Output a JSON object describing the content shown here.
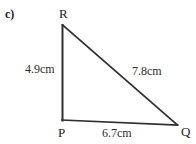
{
  "figure": {
    "item_label": "c)",
    "shape": "right-triangle",
    "stroke_color": "#2f2f2f",
    "text_color": "#2b2b2b",
    "background_color": "#ffffff",
    "vertices": [
      {
        "name": "R",
        "label": "R",
        "x": 62,
        "y": 25
      },
      {
        "name": "P",
        "label": "P",
        "x": 62,
        "y": 120
      },
      {
        "name": "Q",
        "label": "Q",
        "x": 177,
        "y": 125
      }
    ],
    "sides": [
      {
        "name": "PR",
        "label": "4.9cm",
        "from": "P",
        "to": "R",
        "value": 4.9,
        "unit": "cm"
      },
      {
        "name": "RQ",
        "label": "7.8cm",
        "from": "R",
        "to": "Q",
        "value": 7.8,
        "unit": "cm"
      },
      {
        "name": "PQ",
        "label": "6.7cm",
        "from": "P",
        "to": "Q",
        "value": 6.7,
        "unit": "cm"
      }
    ]
  }
}
